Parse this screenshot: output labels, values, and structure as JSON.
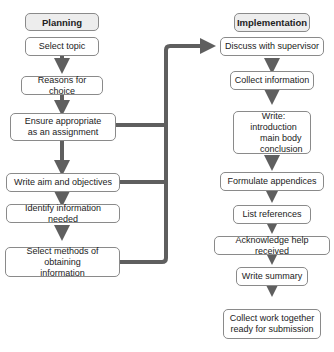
{
  "planning": {
    "title": "Planning",
    "steps": [
      {
        "lines": [
          "Select topic"
        ]
      },
      {
        "lines": [
          "Reasons for choice"
        ]
      },
      {
        "lines": [
          "Ensure appropriate",
          "as an assignment"
        ]
      },
      {
        "lines": [
          "Write aim and objectives"
        ]
      },
      {
        "lines": [
          "Identify information needed"
        ]
      },
      {
        "lines": [
          "Select methods of obtaining",
          "information"
        ]
      }
    ]
  },
  "implementation": {
    "title": "Implementation",
    "steps": [
      {
        "lines": [
          "Discuss with supervisor"
        ]
      },
      {
        "lines": [
          "Collect information"
        ]
      },
      {
        "lines": [
          "Write: introduction",
          "main body",
          "conclusion"
        ]
      },
      {
        "lines": [
          "Formulate appendices"
        ]
      },
      {
        "lines": [
          "List references"
        ]
      },
      {
        "lines": [
          "Acknowledge help received"
        ]
      },
      {
        "lines": [
          "Write summary"
        ]
      },
      {
        "lines": [
          "Collect work together",
          "ready for submission"
        ]
      }
    ]
  },
  "colors": {
    "connector": "#5f5f5f",
    "border": "#8a8a8a",
    "header_bg": "#ededed"
  }
}
